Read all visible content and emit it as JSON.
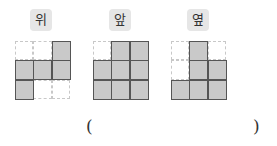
{
  "views": [
    {
      "label": "위",
      "cells": [
        [
          0,
          0,
          1
        ],
        [
          1,
          1,
          1
        ],
        [
          1,
          0,
          0
        ]
      ]
    },
    {
      "label": "앞",
      "cells": [
        [
          0,
          1,
          1
        ],
        [
          1,
          1,
          1
        ],
        [
          1,
          1,
          1
        ]
      ]
    },
    {
      "label": "옆",
      "cells": [
        [
          0,
          1,
          0
        ],
        [
          0,
          1,
          1
        ],
        [
          1,
          1,
          1
        ]
      ]
    }
  ],
  "answer": {
    "open": "(",
    "close": ")",
    "value": ""
  },
  "colors": {
    "filled": "#c9c9c9",
    "border": "#555555",
    "dashed": "#c8c8c8",
    "label_bg": "#e6e6e6"
  }
}
